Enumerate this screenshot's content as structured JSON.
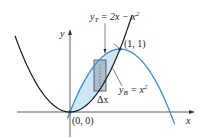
{
  "diagram": {
    "curves": [
      {
        "name": "top",
        "label_main": "y",
        "label_sub": "T",
        "label_rest": " = 2x − x",
        "label_sup": "2",
        "color": "#3a8fd0"
      },
      {
        "name": "bottom",
        "label_main": "y",
        "label_sub": "B",
        "label_rest": " = x",
        "label_sup": "2",
        "color": "#1a1a1a"
      }
    ],
    "fill_color": "#cfe6f7",
    "axes": {
      "x_label": "x",
      "y_label": "y"
    },
    "points": [
      {
        "label": "(0, 0)",
        "x": 0,
        "y": 0
      },
      {
        "label": "(1, 1)",
        "x": 1,
        "y": 1
      }
    ],
    "strip_label": "Δx",
    "strip_color": "#8e9aa8"
  }
}
